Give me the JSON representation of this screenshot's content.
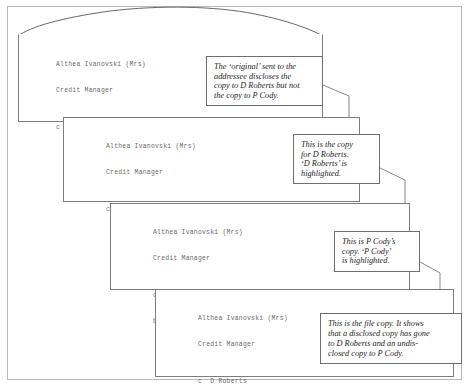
{
  "figure": {
    "letters": [
      {
        "id": "original",
        "name": "letter-original",
        "signature_name": "Althea Ivanovski (Mrs)",
        "signature_title": "Credit Manager",
        "copy_lines": [
          "c D Roberts"
        ]
      },
      {
        "id": "d-roberts-copy",
        "name": "letter-d-roberts-copy",
        "signature_name": "Althea Ivanovski (Mrs)",
        "signature_title": "Credit Manager",
        "copy_lines": [
          "c D Roberts"
        ]
      },
      {
        "id": "p-cody-copy",
        "name": "letter-p-cody-copy",
        "signature_name": "Althea Ivanovski (Mrs)",
        "signature_title": "Credit Manager",
        "copy_lines": [
          "c  D Roberts",
          "bc P Cody"
        ]
      },
      {
        "id": "file-copy",
        "name": "letter-file-copy",
        "signature_name": "Althea Ivanovski (Mrs)",
        "signature_title": "Credit Manager",
        "copy_lines": [
          "c  D Roberts",
          "bc P Cody"
        ]
      }
    ],
    "callouts": [
      {
        "id": "callout-original",
        "name": "callout-original",
        "lines": [
          "The ‘original’ sent to the",
          "addressee discloses the",
          "copy to D Roberts but not",
          "the copy to P Cody."
        ]
      },
      {
        "id": "callout-d-roberts",
        "name": "callout-d-roberts-copy",
        "lines": [
          "This is the copy",
          "for D Roberts.",
          "‘D Roberts’ is",
          "highlighted."
        ]
      },
      {
        "id": "callout-p-cody",
        "name": "callout-p-cody-copy",
        "lines": [
          "This is P Cody’s",
          "copy. ‘P Cody’",
          "is highlighted."
        ]
      },
      {
        "id": "callout-file-copy",
        "name": "callout-file-copy",
        "lines": [
          "This is the file copy. It shows",
          "that a disclosed copy has gone",
          "to D Roberts and an undis-",
          "closed copy to P Cody."
        ]
      }
    ],
    "colors": {
      "page_background": "#ffffff",
      "outer_frame_border": "#b9b9b9",
      "sheet_border": "#7d7d7d",
      "callout_border": "#6e6e6e",
      "letter_text": "#6b6b6b",
      "callout_text": "#1d1d1d",
      "connector_line": "#555555"
    }
  }
}
